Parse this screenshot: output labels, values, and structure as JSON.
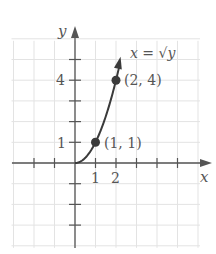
{
  "chart_data": {
    "type": "line",
    "title": "",
    "xlabel": "x",
    "ylabel": "y",
    "equation_label": "x = √y",
    "xlim": [
      -3,
      6
    ],
    "ylim": [
      -4,
      6
    ],
    "grid": true,
    "x_tick_labels": [
      "1",
      "2"
    ],
    "y_tick_labels": [
      "1",
      "4"
    ],
    "x_ticks": [
      -2,
      -1,
      1,
      2,
      3,
      4,
      5
    ],
    "y_ticks": [
      -3,
      -2,
      -1,
      1,
      2,
      3,
      4,
      5
    ],
    "series": [
      {
        "name": "x = √y",
        "x": [
          0,
          0.5,
          1,
          1.5,
          2,
          2.2
        ],
        "y": [
          0,
          0.25,
          1,
          2.25,
          4,
          4.84
        ]
      }
    ],
    "points": [
      {
        "x": 1,
        "y": 1,
        "label": "(1, 1)"
      },
      {
        "x": 2,
        "y": 4,
        "label": "(2, 4)"
      }
    ]
  },
  "colors": {
    "axis": "#555555",
    "grid": "#e3e3e3",
    "curve": "#3a3a3a",
    "text": "#555555"
  }
}
